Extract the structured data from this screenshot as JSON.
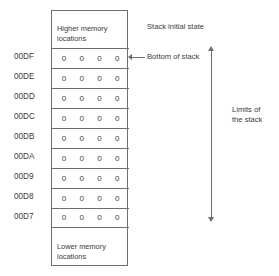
{
  "diagram": {
    "title": "Stack initial state",
    "table": {
      "header_caption": "Higher memory\nlocations",
      "footer_caption": "Lower memory\nlocations",
      "columns": 4,
      "rows": [
        {
          "address": "00DF",
          "cells": [
            "0",
            "0",
            "0",
            "0"
          ]
        },
        {
          "address": "00DE",
          "cells": [
            "0",
            "0",
            "0",
            "0"
          ]
        },
        {
          "address": "00DD",
          "cells": [
            "0",
            "0",
            "0",
            "0"
          ]
        },
        {
          "address": "00DC",
          "cells": [
            "0",
            "0",
            "0",
            "0"
          ]
        },
        {
          "address": "00DB",
          "cells": [
            "0",
            "0",
            "0",
            "0"
          ]
        },
        {
          "address": "00DA",
          "cells": [
            "0",
            "0",
            "0",
            "0"
          ]
        },
        {
          "address": "00D9",
          "cells": [
            "0",
            "0",
            "0",
            "0"
          ]
        },
        {
          "address": "00D8",
          "cells": [
            "0",
            "0",
            "0",
            "0"
          ]
        },
        {
          "address": "00D7",
          "cells": [
            "0",
            "0",
            "0",
            "0"
          ]
        }
      ]
    },
    "annotations": {
      "bottom_of_stack": "Bottom of stack",
      "limits_of_stack": "Limits of\nthe stack"
    },
    "colors": {
      "line": "#6e6e6e",
      "text": "#3b3b3b",
      "background": "#ffffff"
    }
  }
}
